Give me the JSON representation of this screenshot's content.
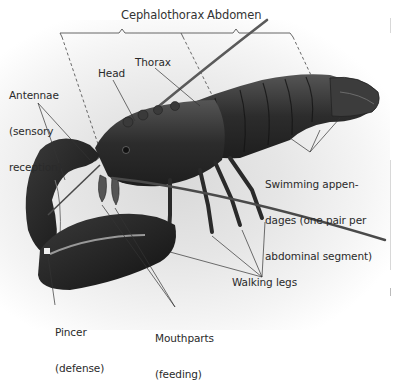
{
  "figure": {
    "colors": {
      "body": "#2e2e2e",
      "shading": "#4a4a4a",
      "label_text": "#2a2a2a",
      "leader_line": "#333333",
      "background_glow": "#dcdcdc"
    }
  },
  "region_brackets": [
    {
      "id": "cephalothorax",
      "label": "Cephalothorax"
    },
    {
      "id": "abdomen",
      "label": "Abdomen"
    }
  ],
  "labels": {
    "antennae": {
      "line1": "Antennae",
      "line2": "(sensory",
      "line3": "reception)"
    },
    "head": {
      "text": "Head"
    },
    "thorax": {
      "text": "Thorax"
    },
    "swimming": {
      "line1": "Swimming appen-",
      "line2": "dages (one pair per",
      "line3": "abdominal segment)"
    },
    "walking_legs": {
      "text": "Walking legs"
    },
    "pincer": {
      "line1": "Pincer",
      "line2": "(defense)"
    },
    "mouthparts": {
      "line1": "Mouthparts",
      "line2": "(feeding)"
    }
  }
}
